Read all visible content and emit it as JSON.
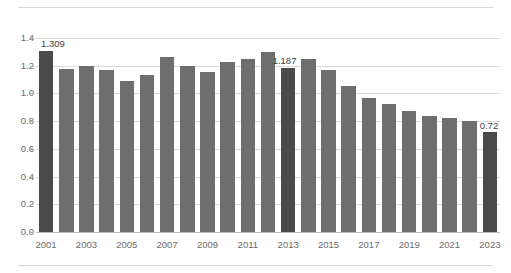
{
  "chart_data": {
    "type": "bar",
    "title": "",
    "subtitle": "",
    "xlabel": "",
    "ylabel": "",
    "ylim": [
      0.0,
      1.4
    ],
    "ytick_labels": [
      "0.0",
      "0.2",
      "0.4",
      "0.6",
      "0.8",
      "1.0",
      "1.2",
      "1.4"
    ],
    "ytick_values": [
      0.0,
      0.2,
      0.4,
      0.6,
      0.8,
      1.0,
      1.2,
      1.4
    ],
    "grid": true,
    "legend": "none",
    "categories": [
      "2001",
      "2002",
      "2003",
      "2004",
      "2005",
      "2006",
      "2007",
      "2008",
      "2009",
      "2010",
      "2011",
      "2012",
      "2013",
      "2014",
      "2015",
      "2016",
      "2017",
      "2018",
      "2019",
      "2020",
      "2021",
      "2022",
      "2023"
    ],
    "xtick_labels_shown": [
      "2001",
      "2003",
      "2005",
      "2007",
      "2009",
      "2011",
      "2013",
      "2015",
      "2017",
      "2019",
      "2021",
      "2023"
    ],
    "values": [
      1.309,
      1.18,
      1.195,
      1.17,
      1.09,
      1.135,
      1.26,
      1.195,
      1.155,
      1.225,
      1.25,
      1.3,
      1.187,
      1.245,
      1.17,
      1.055,
      0.97,
      0.925,
      0.875,
      0.84,
      0.825,
      0.8,
      0.72
    ],
    "highlighted": [
      {
        "category": "2001",
        "value": 1.309,
        "label": "1.309"
      },
      {
        "category": "2013",
        "value": 1.187,
        "label": "1.187"
      },
      {
        "category": "2023",
        "value": 0.72,
        "label": "0.72"
      }
    ],
    "colors": {
      "bar": "#6e6e6e",
      "bar_highlight": "#4a4a4a",
      "gridline": "#d9d9d9",
      "axis": "#bdbdbd",
      "tick_text": "#6b6b6b",
      "data_label": "#3f3f3f",
      "background": "#ffffff",
      "rule": "#d6d6d6"
    }
  }
}
